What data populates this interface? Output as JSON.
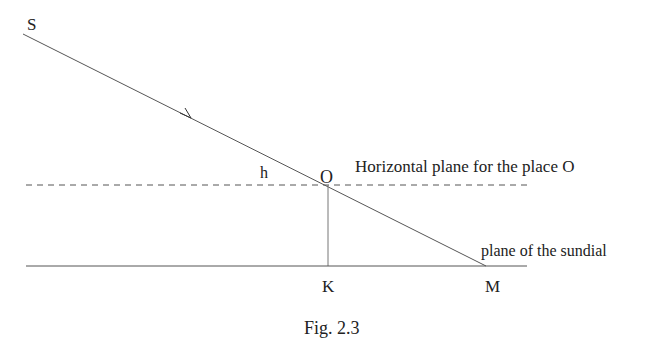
{
  "figure": {
    "caption": "Fig. 2.3",
    "labels": {
      "S": "S",
      "h": "h",
      "O": "O",
      "K": "K",
      "M": "M",
      "horizontal_plane": "Horizontal plane for the place O",
      "sundial_plane": "plane of the sundial"
    },
    "colors": {
      "line": "#555555",
      "text": "#222222",
      "background": "#ffffff"
    }
  }
}
